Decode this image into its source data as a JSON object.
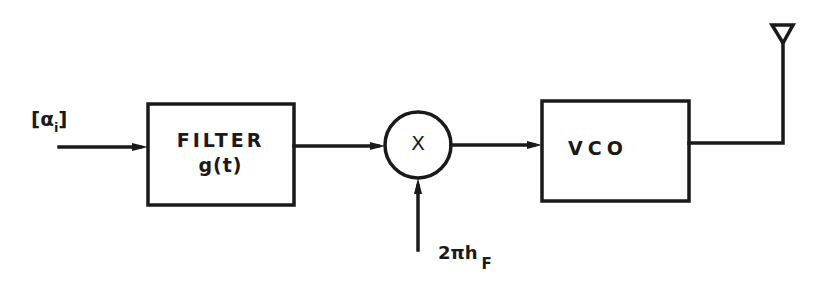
{
  "diagram": {
    "type": "block-diagram",
    "input": {
      "label": "[α",
      "subscript": "i",
      "label_close": "]"
    },
    "blocks": [
      {
        "id": "filter",
        "title": "FILTER",
        "subtitle": "g(t)"
      },
      {
        "id": "multiplier",
        "symbol": "X"
      },
      {
        "id": "vco",
        "title": "VCO"
      }
    ],
    "control_input": {
      "label": "2πh",
      "subscript": "F"
    },
    "output": {
      "symbol": "antenna"
    },
    "connections": [
      {
        "from": "input",
        "to": "filter"
      },
      {
        "from": "filter",
        "to": "multiplier"
      },
      {
        "from": "control_input",
        "to": "multiplier"
      },
      {
        "from": "multiplier",
        "to": "vco"
      },
      {
        "from": "vco",
        "to": "antenna"
      }
    ],
    "colors": {
      "stroke": "#1a1a1a",
      "background": "#ffffff"
    }
  }
}
